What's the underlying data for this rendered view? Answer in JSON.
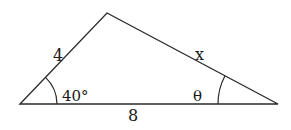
{
  "diagram": {
    "type": "triangle",
    "vertices": {
      "left": [
        20,
        104
      ],
      "apex": [
        107,
        13
      ],
      "right": [
        278,
        104
      ]
    },
    "labels": {
      "left_side": "4",
      "right_side": "x",
      "base": "8",
      "left_angle": "40°",
      "right_angle": "θ"
    },
    "colors": {
      "stroke": "#2a2a2a",
      "text": "#1a1a1a",
      "background": "#ffffff"
    }
  }
}
